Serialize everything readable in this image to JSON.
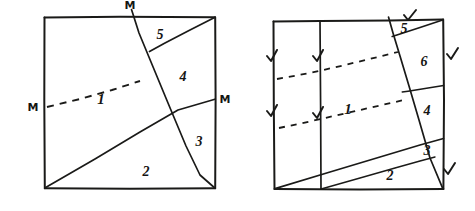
{
  "figure": {
    "ink_color": "#1a1a18",
    "background_color": "#ffffff",
    "panels": [
      {
        "id": "left-panel",
        "name": "left-square",
        "shape": "square",
        "piece_labels": [
          "1",
          "2",
          "3",
          "4",
          "5"
        ],
        "point_labels": [
          "M",
          "M",
          "M"
        ],
        "dashed_lines": 1,
        "tick_marks": 0
      },
      {
        "id": "right-panel",
        "name": "right-square",
        "shape": "square",
        "piece_labels": [
          "1",
          "2",
          "3",
          "4",
          "5",
          "6"
        ],
        "point_labels": [],
        "dashed_lines": 2,
        "tick_marks": 7
      }
    ]
  },
  "left": {
    "labels": {
      "one": "1",
      "two": "2",
      "three": "3",
      "four": "4",
      "five": "5",
      "m_top": "M",
      "m_left": "M",
      "m_right": "M"
    }
  },
  "right": {
    "labels": {
      "one": "1",
      "two": "2",
      "three": "3",
      "four": "4",
      "five": "5",
      "six": "6"
    }
  }
}
